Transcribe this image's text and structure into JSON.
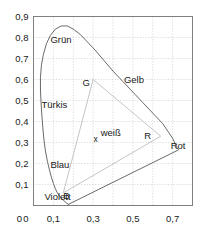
{
  "chart_data": {
    "type": "line",
    "title": "",
    "subtitle": "",
    "xlabel": "",
    "ylabel": "",
    "xlim": [
      0,
      0.8
    ],
    "ylim": [
      0,
      0.9
    ],
    "grid": true,
    "legend_position": "none",
    "x_ticks": [
      {
        "value": 0.0,
        "label": "0"
      },
      {
        "value": 0.1,
        "label": "0,1"
      },
      {
        "value": 0.3,
        "label": "0,3"
      },
      {
        "value": 0.5,
        "label": "0,5"
      },
      {
        "value": 0.7,
        "label": "0,7"
      }
    ],
    "x_gridlines": [
      0.1,
      0.2,
      0.3,
      0.4,
      0.5,
      0.6,
      0.7
    ],
    "y_ticks": [
      {
        "value": 0.0,
        "label": "0"
      },
      {
        "value": 0.1,
        "label": "0,1"
      },
      {
        "value": 0.2,
        "label": "0,2"
      },
      {
        "value": 0.3,
        "label": "0,3"
      },
      {
        "value": 0.4,
        "label": "0,4"
      },
      {
        "value": 0.5,
        "label": "0,5"
      },
      {
        "value": 0.6,
        "label": "0,6"
      },
      {
        "value": 0.7,
        "label": "0,7"
      },
      {
        "value": 0.8,
        "label": "0,8"
      },
      {
        "value": 0.9,
        "label": "0,9"
      }
    ],
    "y_gridlines": [
      0.1,
      0.2,
      0.3,
      0.4,
      0.5,
      0.6,
      0.7,
      0.8
    ],
    "series": [
      {
        "name": "spectral-locus",
        "type": "closed-curve",
        "points": [
          [
            0.175,
            0.005
          ],
          [
            0.15,
            0.025
          ],
          [
            0.135,
            0.04
          ],
          [
            0.12,
            0.06
          ],
          [
            0.11,
            0.08
          ],
          [
            0.1,
            0.105
          ],
          [
            0.09,
            0.135
          ],
          [
            0.08,
            0.17
          ],
          [
            0.07,
            0.21
          ],
          [
            0.06,
            0.26
          ],
          [
            0.053,
            0.31
          ],
          [
            0.047,
            0.37
          ],
          [
            0.042,
            0.43
          ],
          [
            0.038,
            0.49
          ],
          [
            0.035,
            0.55
          ],
          [
            0.035,
            0.61
          ],
          [
            0.04,
            0.67
          ],
          [
            0.05,
            0.72
          ],
          [
            0.065,
            0.77
          ],
          [
            0.085,
            0.81
          ],
          [
            0.11,
            0.84
          ],
          [
            0.14,
            0.855
          ],
          [
            0.17,
            0.855
          ],
          [
            0.2,
            0.84
          ],
          [
            0.235,
            0.815
          ],
          [
            0.27,
            0.78
          ],
          [
            0.31,
            0.74
          ],
          [
            0.355,
            0.69
          ],
          [
            0.4,
            0.64
          ],
          [
            0.45,
            0.59
          ],
          [
            0.5,
            0.54
          ],
          [
            0.55,
            0.49
          ],
          [
            0.6,
            0.44
          ],
          [
            0.65,
            0.39
          ],
          [
            0.7,
            0.32
          ],
          [
            0.72,
            0.28
          ],
          [
            0.73,
            0.265
          ],
          [
            0.175,
            0.005
          ]
        ]
      },
      {
        "name": "rgb-gamut-triangle",
        "type": "closed-polygon",
        "points": [
          [
            0.3,
            0.6
          ],
          [
            0.64,
            0.33
          ],
          [
            0.15,
            0.06
          ],
          [
            0.3,
            0.6
          ]
        ]
      }
    ],
    "markers": [
      {
        "name": "white-point",
        "glyph": "x",
        "x": 0.333,
        "y": 0.333,
        "label": "weiß"
      }
    ],
    "vertex_labels": [
      {
        "name": "green-primary",
        "text": "G",
        "x": 0.3,
        "y": 0.6
      },
      {
        "name": "red-primary",
        "text": "R",
        "x": 0.64,
        "y": 0.33
      },
      {
        "name": "blue-primary",
        "text": "B",
        "x": 0.15,
        "y": 0.06
      }
    ],
    "region_labels": [
      {
        "name": "gruen",
        "text": "Grün",
        "x": 0.085,
        "y": 0.79
      },
      {
        "name": "tuerkis",
        "text": "Türkis",
        "x": 0.04,
        "y": 0.48
      },
      {
        "name": "blau",
        "text": "Blau",
        "x": 0.085,
        "y": 0.195
      },
      {
        "name": "violett",
        "text": "Violett",
        "x": 0.055,
        "y": 0.045
      },
      {
        "name": "gelb",
        "text": "Gelb",
        "x": 0.455,
        "y": 0.6
      },
      {
        "name": "rot",
        "text": "Rot",
        "x": 0.69,
        "y": 0.285
      }
    ],
    "colors": {
      "axis": "#808080",
      "grid": "#cccccc",
      "locus": "#595959",
      "gamut": "#bdbdbd",
      "text": "#1a1a1a",
      "background": "#ffffff"
    }
  }
}
